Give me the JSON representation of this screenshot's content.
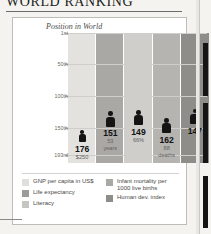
{
  "title": "WORLD RANKING",
  "chart_data": {
    "type": "bar",
    "title": "WORLD RANKING",
    "subtitle": "Position in World",
    "xlabel": "",
    "ylabel": "Position in World",
    "ylim": [
      1,
      193
    ],
    "grid": true,
    "legend_position": "bottom",
    "ytick_labels": [
      "1st",
      "50th",
      "100th",
      "150th",
      "193rd"
    ],
    "ytick_values": [
      1,
      50,
      100,
      150,
      193
    ],
    "categories": [
      "GNP per capita in US$",
      "Life expectancy",
      "Literacy",
      "Infant mortality per 1000 live births",
      "Human dev. index"
    ],
    "values": [
      176,
      151,
      149,
      162,
      147
    ],
    "data_labels": [
      {
        "rank": "176",
        "sub": "$250",
        "sub2": ""
      },
      {
        "rank": "151",
        "sub": "53",
        "sub2": "years"
      },
      {
        "rank": "149",
        "sub": "66%",
        "sub2": ""
      },
      {
        "rank": "162",
        "sub": "88",
        "sub2": "deaths"
      },
      {
        "rank": "147",
        "sub": "",
        "sub2": ""
      }
    ],
    "colors": [
      "#e3e2df",
      "#a9a8a5",
      "#cfcecb",
      "#b5b4b1",
      "#8e8d8a"
    ]
  },
  "legend": {
    "left": [
      {
        "label": "GNP per capita in US$",
        "label2": "",
        "color": "#e0dfdc"
      },
      {
        "label": "Life expectancy",
        "label2": "",
        "color": "#9d9c99"
      },
      {
        "label": "Literacy",
        "label2": "",
        "color": "#c6c5c2"
      }
    ],
    "right": [
      {
        "label": "Infant mortality per",
        "label2": "1000 live births",
        "color": "#a9a8a5"
      },
      {
        "label": "Human dev. index",
        "label2": "",
        "color": "#8e8d8a"
      }
    ]
  }
}
